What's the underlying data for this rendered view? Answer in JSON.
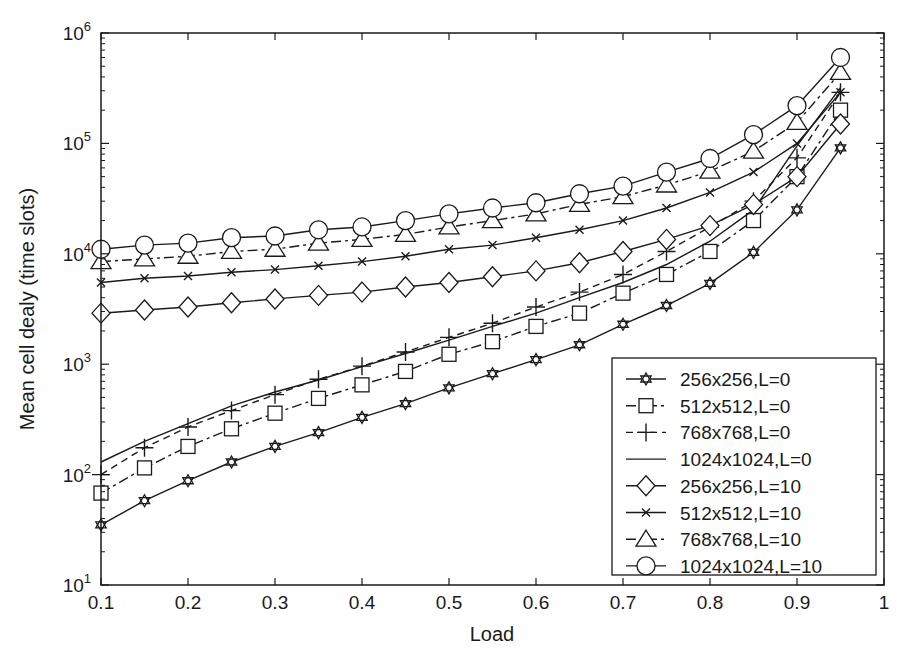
{
  "chart_data": {
    "type": "line",
    "title": "",
    "xlabel": "Load",
    "ylabel": "Mean cell dealy (time slots)",
    "xlim": [
      0.1,
      1.0
    ],
    "ylim": [
      10,
      1000000
    ],
    "yscale": "log",
    "grid": false,
    "legend_position": "lower right",
    "x_ticks": [
      "0.1",
      "0.2",
      "0.3",
      "0.4",
      "0.5",
      "0.6",
      "0.7",
      "0.8",
      "0.9",
      "1"
    ],
    "y_ticks": [
      {
        "base": "10",
        "exp": "1"
      },
      {
        "base": "10",
        "exp": "2"
      },
      {
        "base": "10",
        "exp": "3"
      },
      {
        "base": "10",
        "exp": "4"
      },
      {
        "base": "10",
        "exp": "5"
      },
      {
        "base": "10",
        "exp": "6"
      }
    ],
    "x": [
      0.1,
      0.15,
      0.2,
      0.25,
      0.3,
      0.35,
      0.4,
      0.45,
      0.5,
      0.55,
      0.6,
      0.65,
      0.7,
      0.75,
      0.8,
      0.85,
      0.9,
      0.95
    ],
    "series": [
      {
        "name": "256x256,L=0",
        "marker": "hexagram",
        "line": "solid",
        "values": [
          35,
          58,
          88,
          130,
          180,
          240,
          330,
          440,
          610,
          820,
          1100,
          1500,
          2300,
          3400,
          5400,
          10300,
          25000,
          91000
        ]
      },
      {
        "name": "512x512,L=0",
        "marker": "square",
        "line": "dashdot",
        "values": [
          68,
          115,
          180,
          260,
          360,
          490,
          650,
          860,
          1230,
          1600,
          2200,
          2900,
          4400,
          6500,
          10500,
          20000,
          50000,
          200000
        ]
      },
      {
        "name": "768x768,L=0",
        "marker": "plus",
        "line": "dashed",
        "values": [
          100,
          175,
          270,
          380,
          530,
          730,
          960,
          1290,
          1750,
          2350,
          3300,
          4500,
          6500,
          10500,
          17500,
          30000,
          74000,
          290000
        ]
      },
      {
        "name": "1024x1024,L=0",
        "marker": "none",
        "line": "solid",
        "values": [
          130,
          200,
          290,
          420,
          560,
          720,
          950,
          1250,
          1650,
          2200,
          2900,
          4000,
          5500,
          8000,
          13000,
          25000,
          95000,
          320000
        ]
      },
      {
        "name": "256x256,L=10",
        "marker": "diamond",
        "line": "solid",
        "values": [
          2900,
          3100,
          3300,
          3600,
          3900,
          4200,
          4500,
          5000,
          5500,
          6200,
          7000,
          8300,
          10500,
          13500,
          18000,
          28000,
          50000,
          150000
        ]
      },
      {
        "name": "512x512,L=10",
        "marker": "x",
        "line": "solid",
        "values": [
          5500,
          6000,
          6300,
          6800,
          7200,
          7800,
          8500,
          9500,
          11000,
          12000,
          14000,
          16500,
          20000,
          26000,
          36000,
          55000,
          100000,
          290000
        ]
      },
      {
        "name": "768x768,L=10",
        "marker": "triangle",
        "line": "dashdot",
        "values": [
          8500,
          9000,
          9500,
          10500,
          11000,
          12500,
          13500,
          15000,
          17500,
          20000,
          23000,
          28000,
          33000,
          42000,
          56000,
          85000,
          155000,
          440000
        ]
      },
      {
        "name": "1024x1024,L=10",
        "marker": "circle",
        "line": "solid",
        "values": [
          11000,
          12000,
          12500,
          14000,
          14500,
          16500,
          17500,
          20000,
          23000,
          26000,
          29000,
          35000,
          41000,
          55000,
          73000,
          120000,
          220000,
          600000
        ]
      }
    ]
  },
  "colors": {
    "ink": "#1a1a1a",
    "background": "#ffffff"
  }
}
